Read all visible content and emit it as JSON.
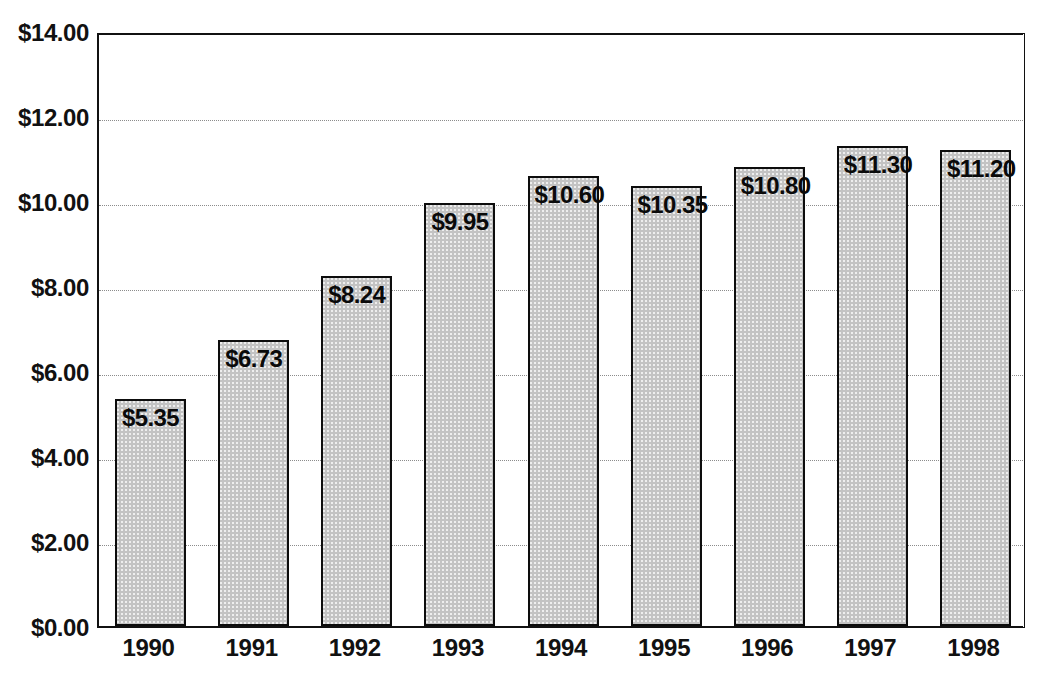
{
  "chart_data": {
    "type": "bar",
    "title": "",
    "xlabel": "",
    "ylabel": "",
    "categories": [
      "1990",
      "1991",
      "1992",
      "1993",
      "1994",
      "1995",
      "1996",
      "1997",
      "1998"
    ],
    "values": [
      5.35,
      6.73,
      8.24,
      9.95,
      10.6,
      10.35,
      10.8,
      11.3,
      11.2
    ],
    "value_labels": [
      "$5.35",
      "$6.73",
      "$8.24",
      "$9.95",
      "$10.60",
      "$10.35",
      "$10.80",
      "$11.30",
      "$11.20"
    ],
    "ylim": [
      0,
      14
    ],
    "y_ticks": [
      0,
      2,
      4,
      6,
      8,
      10,
      12,
      14
    ],
    "y_tick_labels": [
      "$0.00",
      "$2.00",
      "$4.00",
      "$6.00",
      "$8.00",
      "$10.00",
      "$12.00",
      "$14.00"
    ],
    "grid": true,
    "grid_axis": "y",
    "legend": false,
    "bar_fill_color": "#c3c3c3",
    "bar_border_color": "#0d0d0d",
    "axis_color": "#111111",
    "gridline_color": "#8c8c8c",
    "background_color": "#ffffff"
  }
}
